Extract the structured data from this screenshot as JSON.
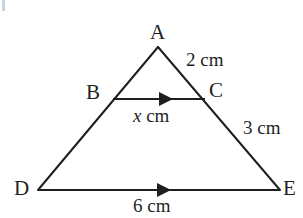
{
  "figure": {
    "type": "geometry-diagram",
    "stroke_color": "#1f1f1f",
    "background_color": "#ffffff",
    "vertices": {
      "A": {
        "label": "A",
        "x": 158,
        "y": 47
      },
      "B": {
        "label": "B",
        "x": 113,
        "y": 99
      },
      "C": {
        "label": "C",
        "x": 205,
        "y": 99
      },
      "D": {
        "label": "D",
        "x": 38,
        "y": 190
      },
      "E": {
        "label": "E",
        "x": 280,
        "y": 190
      }
    },
    "measurements": {
      "side_ac": "2 cm",
      "side_ce": "3 cm",
      "segment_bc_value": "x",
      "segment_bc_unit": "cm",
      "side_de": "6 cm"
    },
    "parallel_marks": {
      "segment_bc": "arrow-right",
      "segment_de": "arrow-right"
    }
  }
}
